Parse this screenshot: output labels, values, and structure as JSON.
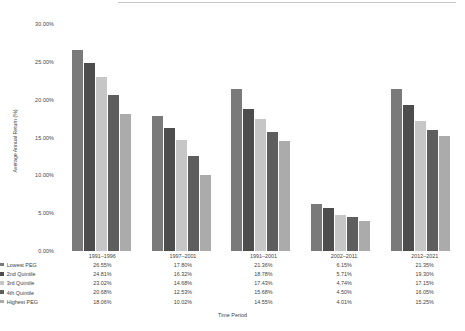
{
  "chart_data": {
    "type": "bar",
    "title": "",
    "xlabel": "Time Period",
    "ylabel": "Average Annual Return (%)",
    "ylim": [
      0,
      30
    ],
    "ytick_values": [
      0,
      5,
      10,
      15,
      20,
      25,
      30
    ],
    "ytick_labels": [
      "0.00%",
      "5.00%",
      "10.00%",
      "15.00%",
      "20.00%",
      "25.00%",
      "30.00%"
    ],
    "grid": false,
    "legend_position": "table-below",
    "categories": [
      "1991–1996",
      "1997–2001",
      "1991–2001",
      "2002–2011",
      "2012–2021"
    ],
    "series": [
      {
        "name": "Lowest PEG",
        "color": "#7a7a7a",
        "values": [
          26.55,
          17.8,
          21.36,
          6.15,
          21.35
        ],
        "labels": [
          "26.55%",
          "17.80%",
          "21.36%",
          "6.15%",
          "21.35%"
        ]
      },
      {
        "name": "2nd Quintile",
        "color": "#4d4d4d",
        "values": [
          24.81,
          16.32,
          18.78,
          5.71,
          19.3
        ],
        "labels": [
          "24.81%",
          "16.32%",
          "18.78%",
          "5.71%",
          "19.30%"
        ]
      },
      {
        "name": "3rd Quintile",
        "color": "#c6c6c6",
        "values": [
          23.02,
          14.68,
          17.43,
          4.74,
          17.15
        ],
        "labels": [
          "23.02%",
          "14.68%",
          "17.43%",
          "4.74%",
          "17.15%"
        ]
      },
      {
        "name": "4th Quintile",
        "color": "#5e5e5e",
        "values": [
          20.68,
          12.53,
          15.68,
          4.5,
          16.05
        ],
        "labels": [
          "20.68%",
          "12.53%",
          "15.68%",
          "4.50%",
          "16.05%"
        ]
      },
      {
        "name": "Highest PEG",
        "color": "#ababab",
        "values": [
          18.06,
          10.02,
          14.55,
          4.01,
          15.25
        ],
        "labels": [
          "18.06%",
          "10.02%",
          "14.55%",
          "4.01%",
          "15.25%"
        ]
      }
    ]
  }
}
